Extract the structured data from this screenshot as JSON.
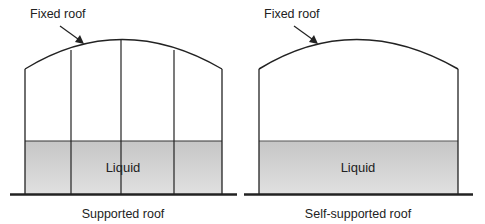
{
  "colors": {
    "stroke": "#222222",
    "liquid_top": "#c8c8c8",
    "liquid_bottom": "#dedede",
    "background": "#ffffff"
  },
  "tanks": [
    {
      "id": "supported",
      "roof_label": "Fixed roof",
      "liquid_label": "Liquid",
      "caption": "Supported roof",
      "support_columns": 3
    },
    {
      "id": "self-supported",
      "roof_label": "Fixed roof",
      "liquid_label": "Liquid",
      "caption": "Self-supported roof",
      "support_columns": 0
    }
  ]
}
